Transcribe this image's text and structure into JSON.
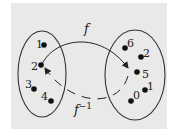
{
  "diagram": {
    "colors": {
      "background": "#e9e9e9",
      "ink": "#222222"
    },
    "domain_set": {
      "elements": [
        {
          "label": "1",
          "x": 44,
          "y": 45
        },
        {
          "label": "2",
          "x": 41,
          "y": 65
        },
        {
          "label": "3",
          "x": 34,
          "y": 89
        },
        {
          "label": "4",
          "x": 51,
          "y": 101
        }
      ]
    },
    "codomain_set": {
      "elements": [
        {
          "label": "6",
          "x": 125,
          "y": 48
        },
        {
          "label": "2",
          "x": 141,
          "y": 57
        },
        {
          "label": "5",
          "x": 137,
          "y": 72
        },
        {
          "label": "1",
          "x": 145,
          "y": 90
        },
        {
          "label": "0",
          "x": 131,
          "y": 101
        }
      ]
    },
    "arrows": {
      "forward": {
        "label": "f",
        "from": "2",
        "to": "5"
      },
      "inverse": {
        "label": "f",
        "superscript": "−1",
        "from": "5",
        "to": "2"
      }
    }
  }
}
